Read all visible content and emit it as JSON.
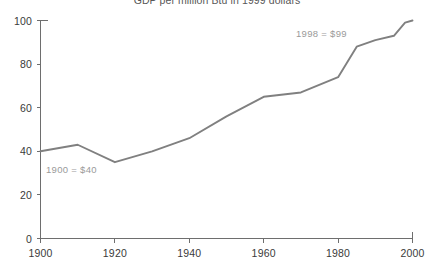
{
  "chart_data": {
    "type": "line",
    "title": "GDP per million Btu in 1999 dollars",
    "xlabel": "",
    "ylabel": "",
    "xlim": [
      1900,
      2000
    ],
    "ylim": [
      0,
      100
    ],
    "grid": false,
    "legend": "none",
    "x_ticks": [
      "1900",
      "1920",
      "1940",
      "1960",
      "1980",
      "2000"
    ],
    "x_tick_values": [
      1900,
      1920,
      1940,
      1960,
      1980,
      2000
    ],
    "y_ticks": [
      "0",
      "20",
      "40",
      "60",
      "80",
      "100"
    ],
    "y_tick_values": [
      0,
      20,
      40,
      60,
      80,
      100
    ],
    "series": [
      {
        "name": "GDP per million Btu",
        "color": "#808080",
        "x": [
          1900,
          1910,
          1920,
          1930,
          1940,
          1950,
          1960,
          1970,
          1980,
          1985,
          1990,
          1995,
          1998,
          2000
        ],
        "values": [
          40,
          43,
          35,
          40,
          46,
          56,
          65,
          67,
          74,
          88,
          91,
          93,
          99,
          100
        ]
      }
    ],
    "annotations": [
      {
        "text": "1900 = $40",
        "x": 1900,
        "y": 40,
        "color": "#9a9a9a"
      },
      {
        "text": "1998 = $99",
        "x": 1998,
        "y": 99,
        "color": "#9a9a9a"
      }
    ]
  },
  "axis_color": "#6e6e6e",
  "tick_label_color": "#3a3a3a",
  "background_color": "#ffffff"
}
